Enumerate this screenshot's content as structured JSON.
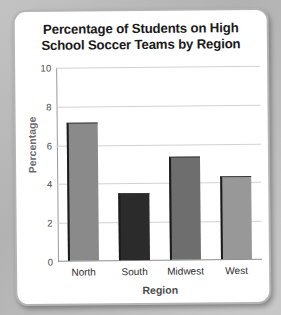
{
  "card": {
    "background_color": "#ffffff",
    "border_color": "#b4b4b4",
    "page_background_color": "#b9b9b9"
  },
  "chart_data": {
    "type": "bar",
    "title": "Percentage of Students on High School Soccer Teams by Region",
    "title_line1": "Percentage of Students on High",
    "title_line2": "School Soccer Teams by Region",
    "xlabel": "Region",
    "ylabel": "Percentage",
    "categories": [
      "North",
      "South",
      "Midwest",
      "West"
    ],
    "values": [
      7.1,
      3.45,
      5.3,
      4.3
    ],
    "bar_colors": [
      "#8a8a8a",
      "#2b2b2b",
      "#6e6e6e",
      "#989898"
    ],
    "ylim": [
      0,
      10
    ],
    "yticks": [
      0,
      2,
      4,
      6,
      8,
      10
    ],
    "ytick_labels": [
      "0",
      "2",
      "4",
      "6",
      "8",
      "10"
    ],
    "grid": true,
    "grid_color": "#d2d2d2",
    "legend": null,
    "legend_position": "none"
  }
}
